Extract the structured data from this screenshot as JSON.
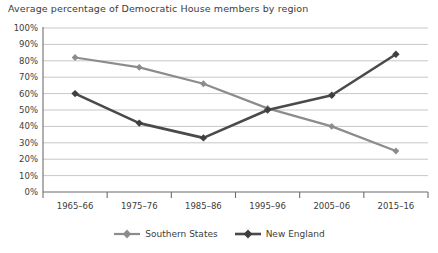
{
  "chart_data": {
    "type": "line",
    "title": "Average percentage of Democratic House members by region",
    "xlabel": "",
    "ylabel": "",
    "categories": [
      "1965–66",
      "1975–76",
      "1985–86",
      "1995–96",
      "2005–06",
      "2015–16"
    ],
    "series": [
      {
        "name": "Southern States",
        "color": "#8c8c8c",
        "marker": "diamond",
        "values": [
          82,
          76,
          66,
          51,
          40,
          25
        ]
      },
      {
        "name": "New England",
        "color": "#4a4a4a",
        "marker": "diamond",
        "values": [
          60,
          42,
          33,
          50,
          59,
          84
        ]
      }
    ],
    "ylim": [
      0,
      100
    ],
    "ytick_step": 10,
    "ytick_labels": [
      "0%",
      "10%",
      "20%",
      "30%",
      "40%",
      "50%",
      "60%",
      "70%",
      "80%",
      "90%",
      "100%"
    ],
    "grid": {
      "horizontal": true,
      "vertical": false,
      "color": "#b9b9b9"
    },
    "legend": {
      "position": "bottom",
      "entries": [
        "Southern States",
        "New England"
      ]
    },
    "axis": {
      "color": "#6d6d6d",
      "ticks_below_axis": true
    },
    "value_suffix": "%"
  }
}
